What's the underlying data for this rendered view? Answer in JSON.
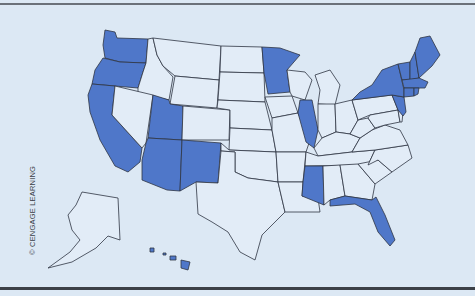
{
  "map": {
    "title": "United States",
    "credit": "© CENGAGE LEARNING",
    "colors": {
      "background": "#dce8f4",
      "highlighted_fill": "#4f77c9",
      "default_fill": "#e2ecf7",
      "border": "#2e3542"
    },
    "highlighted_states": [
      "WA",
      "OR",
      "CA",
      "UT",
      "AZ",
      "NM",
      "MN",
      "IL",
      "MS",
      "FL",
      "NY",
      "NJ",
      "VT",
      "NH",
      "ME",
      "MA",
      "CT",
      "RI",
      "HI"
    ],
    "unhighlighted_states": [
      "ID",
      "MT",
      "WY",
      "NV",
      "CO",
      "ND",
      "SD",
      "NE",
      "KS",
      "OK",
      "TX",
      "IA",
      "MO",
      "AR",
      "LA",
      "WI",
      "MI",
      "IN",
      "OH",
      "KY",
      "TN",
      "AL",
      "GA",
      "SC",
      "NC",
      "VA",
      "WV",
      "PA",
      "MD",
      "DE",
      "AK"
    ]
  }
}
